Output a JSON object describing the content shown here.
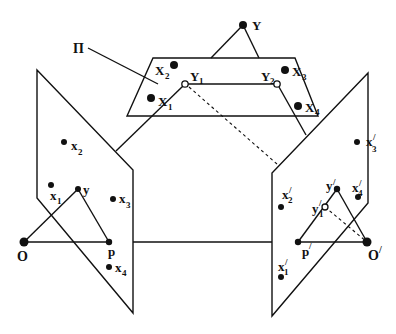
{
  "diagram": {
    "type": "epipolar-geometry",
    "colors": {
      "stroke": "#111111",
      "background": "#ffffff"
    },
    "labels": {
      "plane": "Π",
      "Y": "Y",
      "X1": "X",
      "X1_sub": "1",
      "X2": "X",
      "X2_sub": "2",
      "X3": "X",
      "X3_sub": "3",
      "X4": "X",
      "X4_sub": "4",
      "Y1": "Y",
      "Y1_sub": "1",
      "Y2": "Y",
      "Y2_sub": "2",
      "x1": "x",
      "x1_sub": "1",
      "x2": "x",
      "x2_sub": "2",
      "x3": "x",
      "x3_sub": "3",
      "x4": "x",
      "x4_sub": "4",
      "y": "y",
      "p": "p",
      "O": "O",
      "x1p": "x",
      "x1p_sub": "1",
      "x1p_prime": "/",
      "x2p": "x",
      "x2p_sub": "2",
      "x2p_prime": "/",
      "x3p": "x",
      "x3p_sub": "3",
      "x3p_prime": "/",
      "x4p": "x",
      "x4p_sub": "4",
      "x4p_prime": "/",
      "yp": "y",
      "yp_prime": "/",
      "y1p": "y",
      "y1p_sub": "1",
      "y1p_prime": "/",
      "pp": "p",
      "pp_prime": "/",
      "Op": "O",
      "Op_prime": "/"
    }
  }
}
